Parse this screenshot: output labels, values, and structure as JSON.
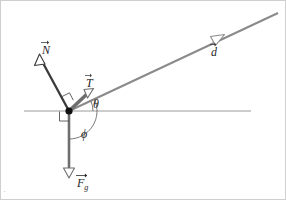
{
  "figure": {
    "type": "free-body-diagram",
    "background_color": "#ffffff",
    "width": 286,
    "height": 200
  },
  "colors": {
    "normal_force": "#3a3a3a",
    "tension": "#6e6e6e",
    "displacement": "#8a8a8a",
    "gravity": "#6e6e6e",
    "axis": "#9a9a9a",
    "arc": "#6b6b6b",
    "origin_dot": "#101010",
    "text": "#262626"
  },
  "origin": {
    "x": 68,
    "y": 110,
    "name": "particle"
  },
  "axis": {
    "name": "horizontal-reference-line",
    "x_start": 23,
    "x_end": 250,
    "y": 110
  },
  "vectors": [
    {
      "id": "N",
      "symbol": "N",
      "subscript": "",
      "label": "N",
      "name": "normal-force-vector",
      "tail": {
        "x": 68,
        "y": 110
      },
      "tip": {
        "x": 40,
        "y": 58
      },
      "color": "#3a3a3a",
      "stroke_width": 2.2,
      "arrowhead": "hollow",
      "label_pos": {
        "x": 41,
        "y": 39
      }
    },
    {
      "id": "T",
      "symbol": "T",
      "subscript": "",
      "label": "T",
      "name": "tension-force-vector",
      "tail": {
        "x": 68,
        "y": 110
      },
      "tip": {
        "x": 89,
        "y": 91
      },
      "color": "#6e6e6e",
      "stroke_width": 3.4,
      "arrowhead": "hollow",
      "label_pos": {
        "x": 85,
        "y": 72
      }
    },
    {
      "id": "d",
      "symbol": "d",
      "subscript": "",
      "label": "d",
      "name": "displacement-vector",
      "tail": {
        "x": 68,
        "y": 110
      },
      "tip": {
        "x": 277,
        "y": 12
      },
      "arrow_at": {
        "x": 216,
        "y": 38
      },
      "color": "#8a8a8a",
      "stroke_width": 2.0,
      "arrowhead": "hollow",
      "label_pos": {
        "x": 210,
        "y": 41
      }
    },
    {
      "id": "Fg",
      "symbol": "F",
      "subscript": "g",
      "label": "Fg",
      "name": "gravity-force-vector",
      "tail": {
        "x": 68,
        "y": 110
      },
      "tip": {
        "x": 68,
        "y": 176
      },
      "color": "#6e6e6e",
      "stroke_width": 2.6,
      "arrowhead": "hollow",
      "label_pos": {
        "x": 76,
        "y": 172
      }
    }
  ],
  "angles": [
    {
      "id": "theta",
      "label": "θ",
      "name": "angle-theta",
      "description": "angle between horizontal reference line and displacement vector",
      "vertex": {
        "x": 68,
        "y": 110
      },
      "radius": 24,
      "from_deg": 0,
      "to_deg": 25,
      "label_pos": {
        "x": 92,
        "y": 97
      }
    },
    {
      "id": "phi",
      "label": "ϕ",
      "name": "angle-phi",
      "description": "angle between gravity vector and displacement vector",
      "vertex": {
        "x": 68,
        "y": 110
      },
      "radius": 28,
      "from_deg": -90,
      "to_deg": 25,
      "label_pos": {
        "x": 80,
        "y": 127
      }
    }
  ],
  "right_angles": [
    {
      "id": "ra-N-T",
      "name": "right-angle-marker-normal-tension",
      "description": "right angle between normal force and tension/incline direction",
      "vertex": {
        "x": 68,
        "y": 110
      },
      "size": 9
    },
    {
      "id": "ra-axis-Fg",
      "name": "right-angle-marker-axis-gravity",
      "description": "right angle between horizontal reference line and gravity",
      "vertex": {
        "x": 68,
        "y": 110
      },
      "size": 9
    }
  ],
  "corner_artifact": {
    "name": "corner-scan-artifact",
    "text": "·"
  }
}
